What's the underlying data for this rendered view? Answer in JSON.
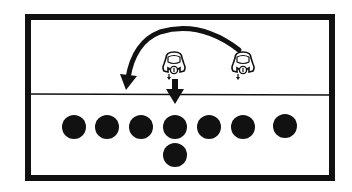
{
  "diagram": {
    "type": "football-play",
    "colors": {
      "ink": "#111111",
      "paper": "#ffffff"
    },
    "frame": {
      "x": 25,
      "y": 14,
      "width": 310,
      "height": 167,
      "border": 6
    },
    "line_of_scrimmage": {
      "y": 94
    },
    "offense": {
      "shape": "circle",
      "radius": 12,
      "players": [
        {
          "x": 74,
          "y": 127
        },
        {
          "x": 107,
          "y": 127
        },
        {
          "x": 141,
          "y": 127
        },
        {
          "x": 175,
          "y": 127
        },
        {
          "x": 209,
          "y": 127
        },
        {
          "x": 243,
          "y": 127
        },
        {
          "x": 285,
          "y": 126
        },
        {
          "x": 175,
          "y": 155
        }
      ]
    },
    "defense": {
      "shape": "helmet",
      "players": [
        {
          "x": 174,
          "y": 64
        },
        {
          "x": 243,
          "y": 64
        }
      ]
    },
    "moves": [
      {
        "kind": "curved-arrow",
        "from": [
          240,
          50
        ],
        "to": [
          127,
          88
        ]
      },
      {
        "kind": "straight-arrow",
        "from": [
          175,
          79
        ],
        "to": [
          175,
          104
        ]
      }
    ]
  }
}
